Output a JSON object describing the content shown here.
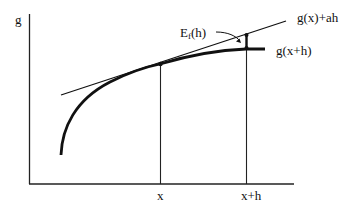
{
  "diagram": {
    "type": "function-approximation-diagram",
    "axes": {
      "y_label": "g",
      "x_ticks": [
        "x",
        "x+h"
      ]
    },
    "curves": [
      {
        "name": "g-curve",
        "description": "concave increasing function g"
      },
      {
        "name": "tangent-line",
        "label": "g(x)+ah"
      }
    ],
    "labels": {
      "y_axis": "g",
      "tangent": "g(x)+ah",
      "curve_at_xh": "g(x+h)",
      "error_main": "E",
      "error_sub": "f",
      "error_arg": "(h)",
      "tick_x": "x",
      "tick_xh": "x+h"
    },
    "colors": {
      "stroke": "#111111",
      "background": "#ffffff"
    }
  }
}
